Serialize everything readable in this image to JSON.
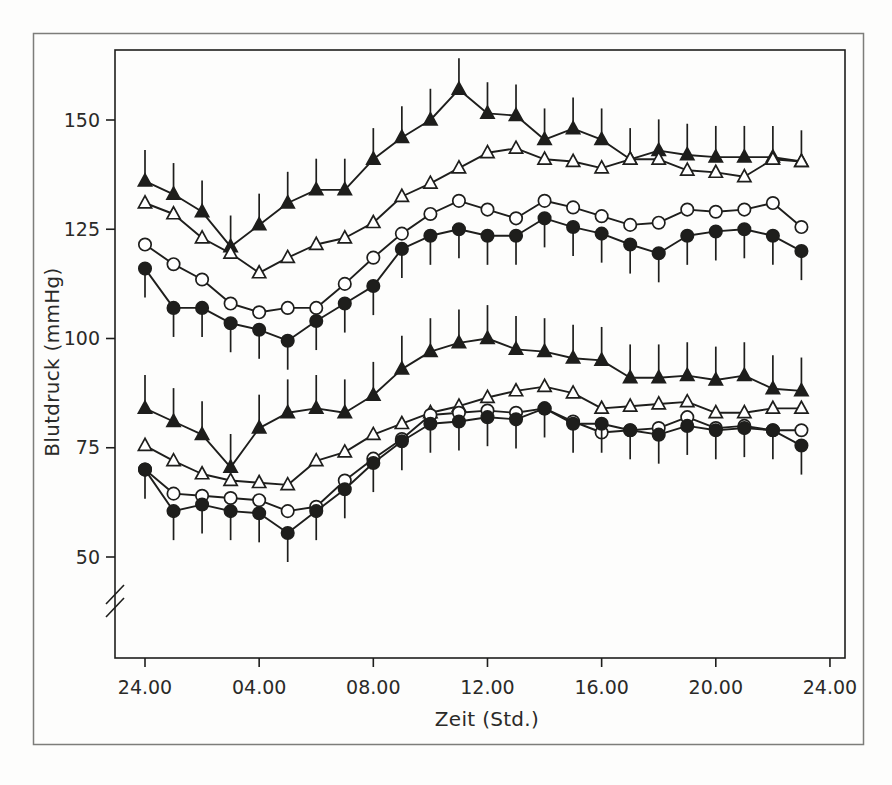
{
  "figure": {
    "border_color": "#7d7d7a",
    "background": "#fdfdfc"
  },
  "chart_data": {
    "type": "line",
    "title": "",
    "xlabel": "Zeit (Std.)",
    "ylabel": "Blutdruck (mmHg)",
    "x_unit": "hour-of-day",
    "x_hours": [
      0,
      1,
      2,
      3,
      4,
      5,
      6,
      7,
      8,
      9,
      10,
      11,
      12,
      13,
      14,
      15,
      16,
      17,
      18,
      19,
      20,
      21,
      22,
      23
    ],
    "x_ticks": [
      {
        "hour": 0,
        "label": "24.00"
      },
      {
        "hour": 4,
        "label": "04.00"
      },
      {
        "hour": 8,
        "label": "08.00"
      },
      {
        "hour": 12,
        "label": "12.00"
      },
      {
        "hour": 16,
        "label": "16.00"
      },
      {
        "hour": 20,
        "label": "20.00"
      },
      {
        "hour": 24,
        "label": "24.00"
      }
    ],
    "y_ticks": [
      150,
      125,
      100,
      75,
      50
    ],
    "ylim": [
      40,
      163
    ],
    "axis_break_on_y": true,
    "grid": false,
    "legend": "none",
    "colors": {
      "ink": "#1e1e1c",
      "marker_open_fill": "#ffffff",
      "frame": "#7d7d7a"
    },
    "series": [
      {
        "id": "upper-filled-triangle",
        "marker": "triangle",
        "fill": "filled",
        "error_bars": "up",
        "error_mmhg": 6,
        "values": [
          136,
          133,
          129,
          121,
          126,
          131,
          134,
          134,
          141,
          146,
          150,
          157,
          151.5,
          151,
          145.5,
          148,
          145.5,
          141,
          143,
          142,
          141.5,
          141.5,
          141.5,
          140.5
        ]
      },
      {
        "id": "upper-open-triangle",
        "marker": "triangle",
        "fill": "open",
        "error_bars": "none",
        "error_mmhg": 0,
        "values": [
          131,
          128.5,
          123,
          119.5,
          115,
          118.5,
          121.5,
          123,
          126.5,
          132.5,
          135.5,
          139,
          142.5,
          143.5,
          141,
          140.5,
          139,
          141,
          141,
          138.5,
          138,
          137,
          141,
          140.5
        ]
      },
      {
        "id": "upper-open-circle",
        "marker": "circle",
        "fill": "open",
        "error_bars": "none",
        "error_mmhg": 0,
        "values": [
          121.5,
          117,
          113.5,
          108,
          106,
          107,
          107,
          112.5,
          118.5,
          124,
          128.5,
          131.5,
          129.5,
          127.5,
          131.5,
          130,
          128,
          126,
          126.5,
          129.5,
          129,
          129.5,
          131,
          125.5
        ]
      },
      {
        "id": "upper-filled-circle",
        "marker": "circle",
        "fill": "filled",
        "error_bars": "down",
        "error_mmhg": 5.5,
        "values": [
          116,
          107,
          107,
          103.5,
          102,
          99.5,
          104,
          108,
          112,
          120.5,
          123.5,
          125,
          123.5,
          123.5,
          127.5,
          125.5,
          124,
          121.5,
          119.5,
          123.5,
          124.5,
          125,
          123.5,
          120
        ]
      },
      {
        "id": "lower-filled-triangle",
        "marker": "triangle",
        "fill": "filled",
        "error_bars": "up",
        "error_mmhg": 6.5,
        "values": [
          84,
          81,
          78,
          70.5,
          79.5,
          83,
          84,
          83,
          87,
          93,
          97,
          99,
          100,
          97.5,
          97,
          95.5,
          95,
          91,
          91,
          91.5,
          90.5,
          91.5,
          88.5,
          88
        ]
      },
      {
        "id": "lower-open-triangle",
        "marker": "triangle",
        "fill": "open",
        "error_bars": "none",
        "error_mmhg": 0,
        "values": [
          75.5,
          72,
          69,
          67.5,
          67,
          66.5,
          72,
          74,
          78,
          80.5,
          83,
          84.5,
          86.5,
          88,
          89,
          87.5,
          84,
          84.5,
          85,
          85.5,
          83,
          83,
          84,
          84
        ]
      },
      {
        "id": "lower-open-circle",
        "marker": "circle",
        "fill": "open",
        "error_bars": "none",
        "error_mmhg": 0,
        "values": [
          70,
          64.5,
          64,
          63.5,
          63,
          60.5,
          61.5,
          67.5,
          72.5,
          77,
          82.5,
          83,
          83.5,
          83,
          84,
          81,
          78.5,
          79,
          79.5,
          82,
          79.5,
          80,
          79,
          79
        ]
      },
      {
        "id": "lower-filled-circle",
        "marker": "circle",
        "fill": "filled",
        "error_bars": "down",
        "error_mmhg": 5.5,
        "values": [
          70,
          60.5,
          62,
          60.5,
          60,
          55.5,
          60.5,
          65.5,
          71.5,
          76.5,
          80.5,
          81,
          82,
          81.5,
          84,
          80.5,
          80.5,
          79,
          78,
          80,
          79,
          79.5,
          79,
          75.5
        ]
      }
    ]
  }
}
